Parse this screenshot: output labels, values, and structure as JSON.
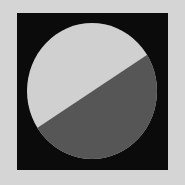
{
  "figure": {
    "colors": {
      "background": "#d5d5d5",
      "frame": "#0b0b0b",
      "light_region": "#d0d0d0",
      "dark_region": "#565656"
    },
    "frame": {
      "x": 17,
      "y": 13,
      "width": 151,
      "height": 157
    },
    "ellipse": {
      "cx": 92,
      "cy": 91,
      "rx": 65,
      "ry": 68
    },
    "divider": {
      "x1": 37,
      "y1": 128,
      "x2": 147,
      "y2": 55
    }
  }
}
